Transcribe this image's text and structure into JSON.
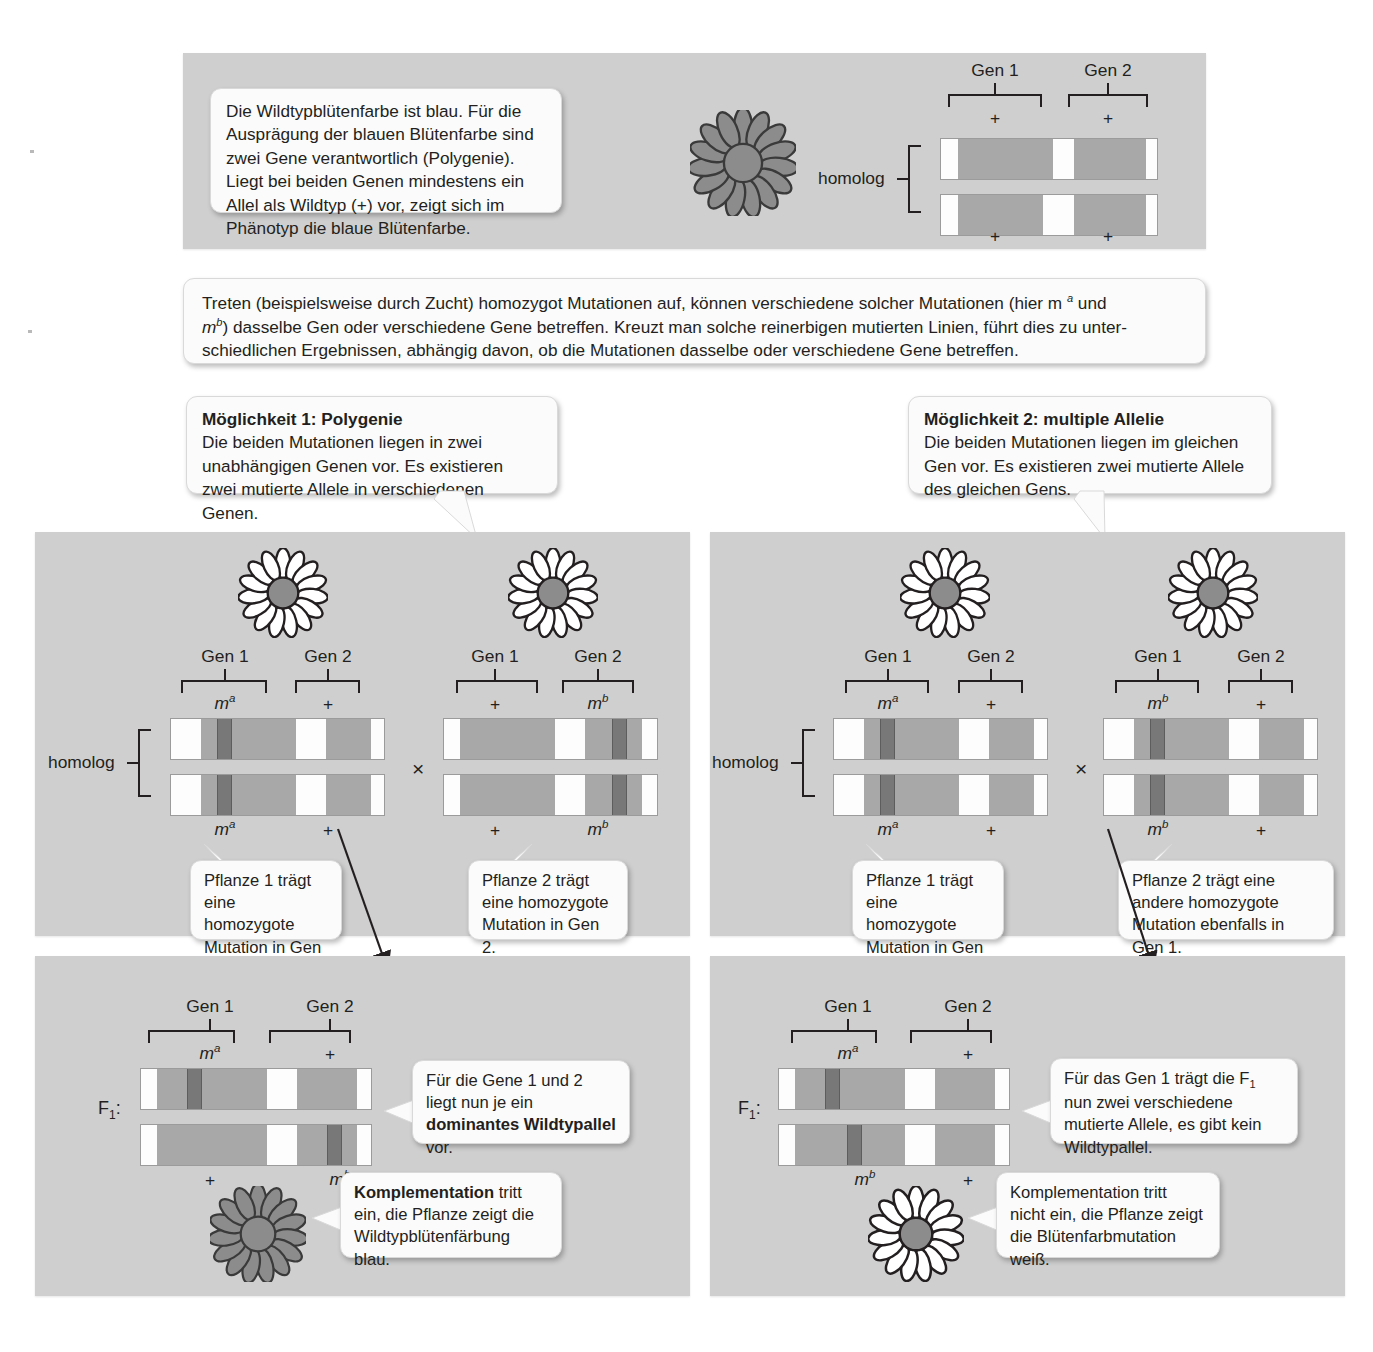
{
  "intro": {
    "text": "Die Wildtypblütenfarbe ist blau. Für die Ausprägung der blauen Blütenfarbe sind zwei Gene verantwortlich (Polygenie). Liegt bei beiden Genen mindestens ein Allel als Wildtyp (+) vor, zeigt sich im Phänotyp die blaue Blütenfarbe."
  },
  "mutation_note": {
    "line1": "Treten (beispielsweise durch Zucht) homozygot Mutationen auf, können verschiedene solcher Mutationen (hier m",
    "sup_a": "a",
    "line1b": " und",
    "line2": "m",
    "sup_b": "b",
    "line2b": ") dasselbe Gen oder verschiedene Gene betreffen. Kreuzt man solche reinerbigen mutierten Linien, führt dies zu unter-",
    "line3": "schiedlichen Ergebnissen, abhängig davon, ob die Mutationen dasselbe oder verschiedene Gene betreffen."
  },
  "option1": {
    "title": "Möglichkeit 1: Polygenie",
    "body": "Die beiden Mutationen liegen in zwei unabhängigen Genen vor. Es existieren zwei mutierte Allele in verschiedenen Genen."
  },
  "option2": {
    "title": "Möglichkeit 2: multiple Allelie",
    "body": "Die beiden Mutationen liegen im gleichen Gen vor. Es existieren zwei mutierte Allele des gleichen Gens."
  },
  "labels": {
    "gen1": "Gen 1",
    "gen2": "Gen 2",
    "homolog": "homolog",
    "plus": "+",
    "cross": "×",
    "f1": "F",
    "f1_sub": "1",
    "f1_colon": ":",
    "m_letter": "m",
    "sup_a": "a",
    "sup_b": "b"
  },
  "callouts": {
    "left_plant1": "Pflanze 1 trägt eine homozygote Mutation in Gen 1.",
    "left_plant2": "Pflanze 2 trägt eine homozygote Mutation in Gen 2.",
    "right_plant1": "Pflanze 1 trägt eine homozygote Mutation in Gen 1.",
    "right_plant2": "Pflanze 2 trägt eine andere homozygote Mutation ebenfalls in Gen 1.",
    "left_f1_pre": "Für die Gene 1 und 2 liegt nun je ein ",
    "left_f1_bold": "dominantes Wildtypallel",
    "left_f1_post": " vor.",
    "right_f1": "Für das Gen 1 trägt die F1 nun zwei verschiedene mutierte Allele, es gibt kein Wildtypallel.",
    "right_f1_l1a": "Für das Gen 1 trägt die F",
    "right_f1_l1sub": "1",
    "right_f1_l1b": " nun",
    "right_f1_l2": "zwei verschiedene mutierte",
    "right_f1_l3": "Allele, es gibt kein Wildtypallel.",
    "left_result_bold": "Komplementation",
    "left_result_rest": " tritt ein, die Pflanze zeigt die Wildtypblütenfärbung blau.",
    "right_result": "Komplementation tritt nicht ein, die Pflanze zeigt die Blütenfarbmutation weiß."
  },
  "colors": {
    "panel_bg": "#cfcfcf",
    "box_bg": "#fbfbfb",
    "gene_segment": "#a8a8a8",
    "mutation_band": "#787878",
    "flower_wildtype": "#8c8c8c",
    "flower_mutant": "#ffffff",
    "flower_center": "#8c8c8c",
    "outline": "#231f20"
  },
  "chromosomes": {
    "top_wildtype": {
      "gene1_top": "+",
      "gene2_top": "+",
      "gene1_bottom": "+",
      "gene2_bottom": "+",
      "mutations": []
    },
    "left_plant1": {
      "gene1_top": "m",
      "gene1_top_sup": "a",
      "gene2_top": "+",
      "gene1_bottom": "m",
      "gene1_bottom_sup": "a",
      "gene2_bottom": "+",
      "mutations": [
        "gene1-top",
        "gene1-bottom"
      ]
    },
    "left_plant2": {
      "gene1_top": "+",
      "gene2_top": "m",
      "gene2_top_sup": "b",
      "gene1_bottom": "+",
      "gene2_bottom": "m",
      "gene2_bottom_sup": "b",
      "mutations": [
        "gene2-top",
        "gene2-bottom"
      ]
    },
    "left_f1": {
      "gene1_top": "m",
      "gene1_top_sup": "a",
      "gene2_top": "+",
      "gene1_bottom": "+",
      "gene2_bottom": "m",
      "gene2_bottom_sup": "b",
      "mutations": [
        "gene1-top",
        "gene2-bottom"
      ]
    },
    "right_plant1": {
      "gene1_top": "m",
      "gene1_top_sup": "a",
      "gene2_top": "+",
      "gene1_bottom": "m",
      "gene1_bottom_sup": "a",
      "gene2_bottom": "+",
      "mutations": [
        "gene1-top",
        "gene1-bottom"
      ]
    },
    "right_plant2": {
      "gene1_top": "m",
      "gene1_top_sup": "b",
      "gene2_top": "+",
      "gene1_bottom": "m",
      "gene1_bottom_sup": "b",
      "gene2_bottom": "+",
      "mutations": [
        "gene1-top",
        "gene1-bottom"
      ]
    },
    "right_f1": {
      "gene1_top": "m",
      "gene1_top_sup": "a",
      "gene2_top": "+",
      "gene1_bottom": "m",
      "gene1_bottom_sup": "b",
      "gene2_bottom": "+",
      "mutations": [
        "gene1-top",
        "gene1-bottom-offset"
      ]
    }
  }
}
